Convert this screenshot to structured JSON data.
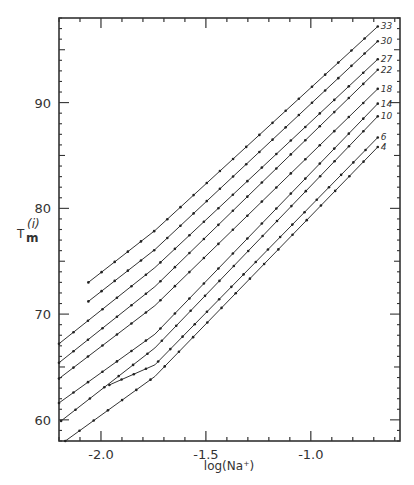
{
  "chart_data": {
    "type": "line",
    "title": "",
    "xlabel": "log(Na+)",
    "ylabel": "Tm(i)",
    "xlim": [
      -2.2,
      -0.575
    ],
    "ylim": [
      58,
      98
    ],
    "x_ticks": [
      -2.0,
      -1.5,
      -1.0
    ],
    "x_tick_labels": [
      "-2.0",
      "-1.5",
      "-1.0"
    ],
    "y_ticks": [
      60,
      70,
      80,
      90
    ],
    "y_tick_labels": [
      "60",
      "70",
      "80",
      "90"
    ],
    "grid": false,
    "legend": "inline labels at right end of each line",
    "series": [
      {
        "name": "33",
        "x": [
          -2.06,
          -1.743,
          -0.681
        ],
        "y": [
          73.0,
          77.9,
          97.2
        ]
      },
      {
        "name": "30",
        "x": [
          -2.06,
          -1.743,
          -0.681
        ],
        "y": [
          71.2,
          76.1,
          95.8
        ]
      },
      {
        "name": "27",
        "x": [
          -2.2,
          -1.743,
          -0.681
        ],
        "y": [
          67.2,
          74.4,
          94.1
        ]
      },
      {
        "name": "22",
        "x": [
          -2.2,
          -1.743,
          -0.681
        ],
        "y": [
          65.4,
          72.6,
          93.1
        ]
      },
      {
        "name": "18",
        "x": [
          -2.2,
          -1.743,
          -0.681
        ],
        "y": [
          63.9,
          70.8,
          91.3
        ]
      },
      {
        "name": "14",
        "x": [
          -2.2,
          -1.743,
          -0.681
        ],
        "y": [
          61.6,
          68.1,
          89.9
        ]
      },
      {
        "name": "10",
        "x": [
          -2.19,
          -1.743,
          -0.681
        ],
        "y": [
          59.9,
          66.8,
          88.7
        ]
      },
      {
        "name": "6",
        "x": [
          -1.96,
          -1.743,
          -0.681
        ],
        "y": [
          63.3,
          65.2,
          86.7
        ]
      },
      {
        "name": "4",
        "x": [
          -2.17,
          -1.743,
          -0.681
        ],
        "y": [
          58.0,
          64.1,
          85.8
        ]
      }
    ]
  },
  "labels": {
    "xlabel": "log(Na⁺)",
    "ylabel_main": "T",
    "ylabel_sub": "m",
    "ylabel_sup": "(i)"
  }
}
